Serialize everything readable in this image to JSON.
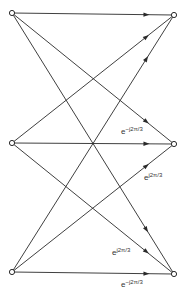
{
  "diagram": {
    "type": "signal-flow-graph",
    "colors": {
      "line": "#2a2a2a",
      "background": "#ffffff"
    },
    "nodes": [
      {
        "id": "in0",
        "side": "left",
        "x": 12,
        "y": 13
      },
      {
        "id": "in1",
        "side": "left",
        "x": 12,
        "y": 143
      },
      {
        "id": "in2",
        "side": "left",
        "x": 12,
        "y": 272
      },
      {
        "id": "out0",
        "side": "right",
        "x": 174,
        "y": 15
      },
      {
        "id": "out1",
        "side": "right",
        "x": 174,
        "y": 144
      },
      {
        "id": "out2",
        "side": "right",
        "x": 174,
        "y": 274
      }
    ],
    "edges": [
      {
        "from": "in0",
        "to": "out0",
        "label": ""
      },
      {
        "from": "in0",
        "to": "out1",
        "label": ""
      },
      {
        "from": "in0",
        "to": "out2",
        "label": ""
      },
      {
        "from": "in1",
        "to": "out0",
        "label": ""
      },
      {
        "from": "in1",
        "to": "out1",
        "label": "e^{-j2π/3}"
      },
      {
        "from": "in1",
        "to": "out2",
        "label": "e^{j2π/3}"
      },
      {
        "from": "in2",
        "to": "out0",
        "label": ""
      },
      {
        "from": "in2",
        "to": "out1",
        "label": "e^{j2π/3}"
      },
      {
        "from": "in2",
        "to": "out2",
        "label": "e^{-j2π/3}"
      }
    ],
    "labels": [
      {
        "base": "e",
        "exp": "−j2π/3",
        "x": 121,
        "y": 126
      },
      {
        "base": "e",
        "exp": "j2π/3",
        "x": 144,
        "y": 172
      },
      {
        "base": "e",
        "exp": "j2π/3",
        "x": 112,
        "y": 247
      },
      {
        "base": "e",
        "exp": "−j2π/3",
        "x": 121,
        "y": 279
      }
    ]
  }
}
